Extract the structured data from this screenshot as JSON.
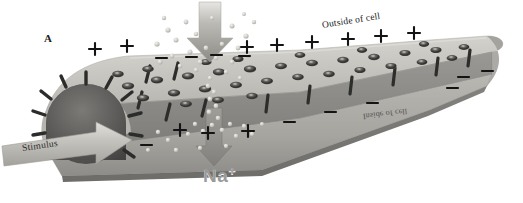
{
  "figure": {
    "panel_letter": "A",
    "title_alt": "Membrane depolarization by stimulus opening sodium channels",
    "background_color": "#ffffff"
  },
  "labels": {
    "panel": "A",
    "outside_of_cell": "Outside of cell",
    "inside_of_cell": "Inside of cell",
    "stimulus": "Stimulus",
    "sodium_ion": "Na",
    "sodium_charge": "+"
  },
  "colors": {
    "membrane_top": "#c9c7c1",
    "membrane_top_light": "#d8d6d0",
    "membrane_front": "#b0aea8",
    "membrane_inner_wall": "#8b8a86",
    "membrane_edge_band": "#6f6e6a",
    "cutaway_interior": "#6a6966",
    "cutaway_interior_dark": "#4f4e4c",
    "channel_dark": "#3a3a38",
    "protein_bar": "#2f2f2e",
    "arrow_fill": "#b9b7b1",
    "arrow_fill_dark": "#8f8d88",
    "ion_fill": "#d9d7d2",
    "charge_plus": "#151515",
    "charge_minus": "#151515",
    "na_label": "#9a9a9a"
  },
  "charges": {
    "plus_outside": [
      {
        "x": 95,
        "y": 49
      },
      {
        "x": 127,
        "y": 46
      },
      {
        "x": 247,
        "y": 47
      },
      {
        "x": 277,
        "y": 45
      },
      {
        "x": 312,
        "y": 42
      },
      {
        "x": 348,
        "y": 39
      },
      {
        "x": 381,
        "y": 36
      },
      {
        "x": 414,
        "y": 33
      }
    ],
    "minus_outside": [
      {
        "x": 161,
        "y": 58
      },
      {
        "x": 191,
        "y": 57
      },
      {
        "x": 216,
        "y": 55
      },
      {
        "x": 244,
        "y": 56
      }
    ],
    "plus_inside": [
      {
        "x": 180,
        "y": 130
      },
      {
        "x": 208,
        "y": 133
      },
      {
        "x": 248,
        "y": 131
      }
    ],
    "minus_inside": [
      {
        "x": 146,
        "y": 145
      },
      {
        "x": 289,
        "y": 122
      },
      {
        "x": 330,
        "y": 112
      },
      {
        "x": 372,
        "y": 103
      },
      {
        "x": 452,
        "y": 88
      },
      {
        "x": 463,
        "y": 77
      },
      {
        "x": 487,
        "y": 71
      }
    ]
  },
  "channels": {
    "count": 34,
    "description": "ion channel pores on outer membrane face"
  },
  "arrows": {
    "stimulus": {
      "label": "Stimulus",
      "direction": "right"
    },
    "influx_top": {
      "label": "",
      "direction": "down"
    },
    "influx_bottom": {
      "label": "Na+",
      "direction": "down"
    }
  }
}
